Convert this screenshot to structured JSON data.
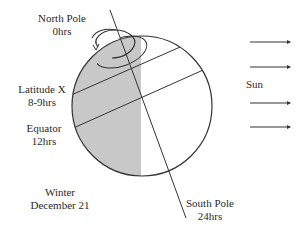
{
  "labels": {
    "north_pole": {
      "name": "North Pole",
      "hours": "0hrs"
    },
    "latitude_x": {
      "name": "Latitude X",
      "hours": "8-9hrs"
    },
    "equator": {
      "name": "Equator",
      "hours": "12hrs"
    },
    "season": {
      "name": "Winter",
      "date": "December 21"
    },
    "south_pole": {
      "name": "South Pole",
      "hours": "24hrs"
    },
    "sun": "Sun"
  },
  "colors": {
    "night_shade": "#c8c8c8",
    "line": "#333333",
    "background": "#ffffff"
  },
  "sun_rays": 4
}
